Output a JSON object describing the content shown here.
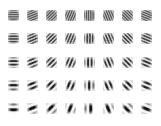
{
  "figure": {
    "rows": 5,
    "cols": 8,
    "orientations_deg": [
      0,
      22.5,
      45,
      67.5,
      90,
      112.5,
      135,
      157.5
    ],
    "row_wavelengths_px": [
      2.2,
      2.8,
      3.6,
      4.6,
      6.0
    ],
    "row_envelope": [
      {
        "bg": "#8a8a8a",
        "contrast": 0.35,
        "mask": 1.0
      },
      {
        "bg": "#9a9a9a",
        "contrast": 0.55,
        "mask": 0.85
      },
      {
        "bg": "#b4b4b4",
        "contrast": 0.75,
        "mask": 0.7
      },
      {
        "bg": "#cccccc",
        "contrast": 0.9,
        "mask": 0.6
      },
      {
        "bg": "#dddddd",
        "contrast": 1.0,
        "mask": 0.55
      }
    ],
    "layout": {
      "x0": 8,
      "y0": 10,
      "col_pitch": 19,
      "row_pitch": 23.3,
      "tile_size": 11
    }
  }
}
